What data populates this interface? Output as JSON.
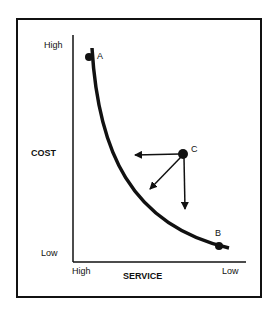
{
  "diagram": {
    "y_axis": {
      "label": "COST",
      "high_label": "High",
      "low_label": "Low"
    },
    "x_axis": {
      "label": "SERVICE",
      "high_label": "High",
      "low_label": "Low"
    },
    "points": [
      {
        "id": "A",
        "label": "A"
      },
      {
        "id": "B",
        "label": "B"
      },
      {
        "id": "C",
        "label": "C"
      }
    ],
    "arrows_from_C": [
      "left",
      "down-left",
      "down"
    ]
  }
}
